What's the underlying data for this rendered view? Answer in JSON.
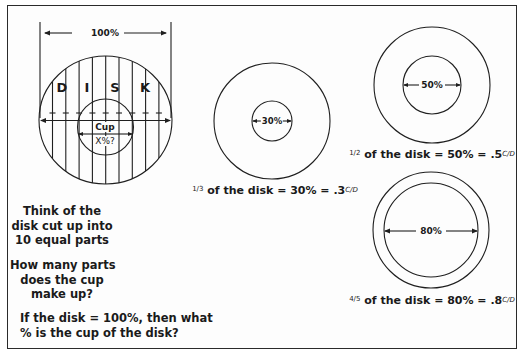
{
  "left_panel": {
    "top_measure_label": "100%",
    "disk_letters": [
      "D",
      "I",
      "S",
      "K"
    ],
    "cup_label": "Cup",
    "cup_measure_label": "X%?",
    "hatch_parts": 10,
    "text_block_1": [
      "Think of the",
      "disk cut up into",
      "10 equal parts"
    ],
    "text_block_2": [
      "How many parts",
      "does the cup",
      "make up?"
    ],
    "text_block_3": [
      "If the disk = 100%, then what",
      "% is the cup of the disk?"
    ]
  },
  "examples": [
    {
      "id": "thirty",
      "inner_label": "30%",
      "fraction": "1/3",
      "caption_rest": "of the disk = 30% = .3",
      "ratio_unit": "C/D",
      "outer_radius": 58,
      "inner_radius": 20
    },
    {
      "id": "fifty",
      "inner_label": "50%",
      "fraction": "1/2",
      "caption_rest": "of the disk = 50% = .5",
      "ratio_unit": "C/D",
      "outer_radius": 58,
      "inner_radius": 29
    },
    {
      "id": "eighty",
      "inner_label": "80%",
      "fraction": "4/5",
      "caption_rest": "of the disk = 80% = .8",
      "ratio_unit": "C/D",
      "outer_radius": 58,
      "inner_radius": 47
    }
  ],
  "colors": {
    "line": "#1f1f1f",
    "background": "#fdfdfd"
  }
}
